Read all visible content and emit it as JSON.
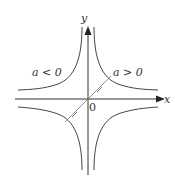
{
  "diagram": {
    "type": "hyperbola-graph",
    "axes": {
      "x_label": "x",
      "y_label": "y",
      "origin_label": "0"
    },
    "curves": [
      {
        "name": "a-positive",
        "label": "a > 0",
        "quadrants": [
          1,
          3
        ]
      },
      {
        "name": "a-negative",
        "label": "a < 0",
        "quadrants": [
          2,
          4
        ]
      }
    ],
    "colors": {
      "axis": "#333333",
      "curve": "#444444",
      "diagonal": "#666666"
    }
  }
}
